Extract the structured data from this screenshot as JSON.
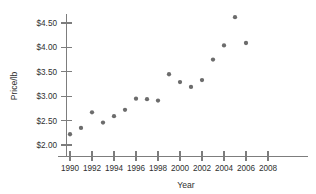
{
  "chart_data": {
    "type": "scatter",
    "title": "",
    "xlabel": "Year",
    "ylabel": "Price/lb",
    "xlim": [
      1989,
      2009
    ],
    "ylim": [
      1.85,
      4.8
    ],
    "grid": false,
    "legend": null,
    "x_ticks": [
      1990,
      1992,
      1994,
      1996,
      1998,
      2000,
      2002,
      2004,
      2006,
      2008
    ],
    "x_tick_labels": [
      "1990",
      "1992",
      "1994",
      "1996",
      "1998",
      "2000",
      "2002",
      "2004",
      "2006",
      "2008"
    ],
    "y_ticks": [
      2.0,
      2.5,
      3.0,
      3.5,
      4.0,
      4.5
    ],
    "y_tick_labels": [
      "$2.00",
      "$2.50",
      "$3.00",
      "$3.50",
      "$4.00",
      "$4.50"
    ],
    "x": [
      1990,
      1991,
      1992,
      1993,
      1994,
      1995,
      1996,
      1997,
      1998,
      1999,
      2000,
      2001,
      2002,
      2003,
      2004,
      2005,
      2006
    ],
    "values": [
      2.22,
      2.35,
      2.67,
      2.46,
      2.59,
      2.72,
      2.95,
      2.94,
      2.91,
      3.45,
      3.29,
      3.19,
      3.33,
      3.75,
      4.04,
      4.62,
      4.09
    ],
    "marker": "circle",
    "marker_color": "#6c6c6c",
    "marker_size": 4.3,
    "axis_color": "#7d7d7d",
    "background_color": "#ffffff",
    "text_color": "#2f2f2f"
  }
}
